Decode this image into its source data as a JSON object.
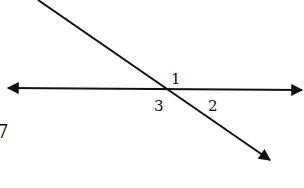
{
  "diagram": {
    "type": "intersecting-lines",
    "colors": {
      "line": "#111111",
      "background": "#ffffff"
    },
    "horizontal_line": {
      "x1": 8,
      "y1": 88,
      "x2": 302,
      "y2": 90,
      "arrows": "both"
    },
    "transversal": {
      "x1": 38,
      "y1": 0,
      "x2": 270,
      "y2": 160,
      "arrows": "end"
    },
    "intersection": {
      "x": 170,
      "y": 89
    },
    "angle_labels": [
      {
        "text": "1",
        "x": 171,
        "y": 74
      },
      {
        "text": "3",
        "x": 154,
        "y": 101
      },
      {
        "text": "2",
        "x": 208,
        "y": 101
      }
    ],
    "edge_label": {
      "text": "7",
      "x": -2,
      "y": 124
    }
  }
}
